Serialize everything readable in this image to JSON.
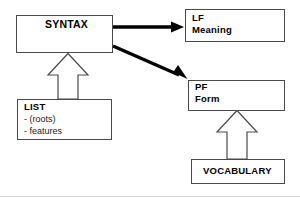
{
  "diagram": {
    "nodes": {
      "syntax": {
        "label": "SYNTAX"
      },
      "lf": {
        "label": "LF",
        "sub": "Meaning"
      },
      "pf": {
        "label": "PF",
        "sub": "Form"
      },
      "list": {
        "label": "LIST",
        "item1": "- (roots)",
        "item2": "- features"
      },
      "vocabulary": {
        "label": "VOCABULARY"
      }
    },
    "edges": [
      {
        "name": "syntax-to-lf",
        "style": "solid-thick-arrow",
        "from": "syntax",
        "to": "lf"
      },
      {
        "name": "syntax-to-pf",
        "style": "solid-thick-arrow",
        "from": "syntax",
        "to": "pf"
      },
      {
        "name": "list-to-syntax",
        "style": "hollow-block-arrow",
        "from": "list",
        "to": "syntax"
      },
      {
        "name": "vocabulary-to-pf",
        "style": "hollow-block-arrow",
        "from": "vocabulary",
        "to": "pf"
      }
    ],
    "colors": {
      "stroke": "#4a4a4a",
      "arrow": "#000000",
      "background": "#ffffff",
      "text": "#000000"
    }
  }
}
